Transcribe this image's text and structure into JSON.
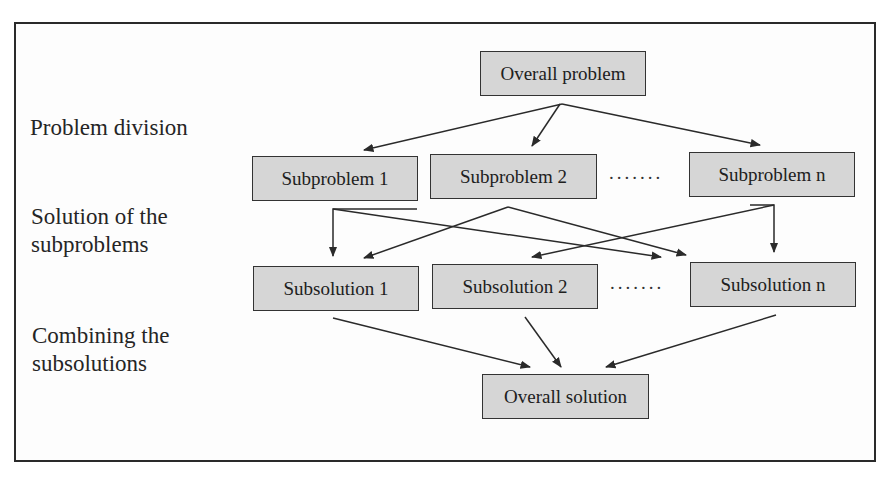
{
  "diagram": {
    "stage_labels": [
      {
        "id": "division",
        "text": "Problem division"
      },
      {
        "id": "solution",
        "text": "Solution of the\nsubproblems"
      },
      {
        "id": "combining",
        "text": "Combining the\nsubsolutions"
      }
    ],
    "nodes": {
      "overall_problem": "Overall problem",
      "subproblems": [
        "Subproblem 1",
        "Subproblem 2",
        "Subproblem n"
      ],
      "subsolutions": [
        "Subsolution 1",
        "Subsolution 2",
        "Subsolution n"
      ],
      "overall_solution": "Overall solution"
    },
    "ellipsis": ".......",
    "edges": [
      {
        "from": "Overall problem",
        "to": "Subproblem 1"
      },
      {
        "from": "Overall problem",
        "to": "Subproblem 2"
      },
      {
        "from": "Overall problem",
        "to": "Subproblem n"
      },
      {
        "from": "Subproblem 1",
        "to": "Subsolution 1"
      },
      {
        "from": "Subproblem 1",
        "to": "Subsolution n"
      },
      {
        "from": "Subproblem 2",
        "to": "Subsolution 1"
      },
      {
        "from": "Subproblem 2",
        "to": "Subsolution n"
      },
      {
        "from": "Subproblem n",
        "to": "Subsolution 2"
      },
      {
        "from": "Subproblem n",
        "to": "Subsolution n"
      },
      {
        "from": "Subsolution 1",
        "to": "Overall solution"
      },
      {
        "from": "Subsolution 2",
        "to": "Overall solution"
      },
      {
        "from": "Subsolution n",
        "to": "Overall solution"
      }
    ],
    "colors": {
      "box_fill": "#d6d6d6",
      "box_border": "#333333",
      "line": "#2a2a2a",
      "frame": "#2a2a2a"
    }
  }
}
